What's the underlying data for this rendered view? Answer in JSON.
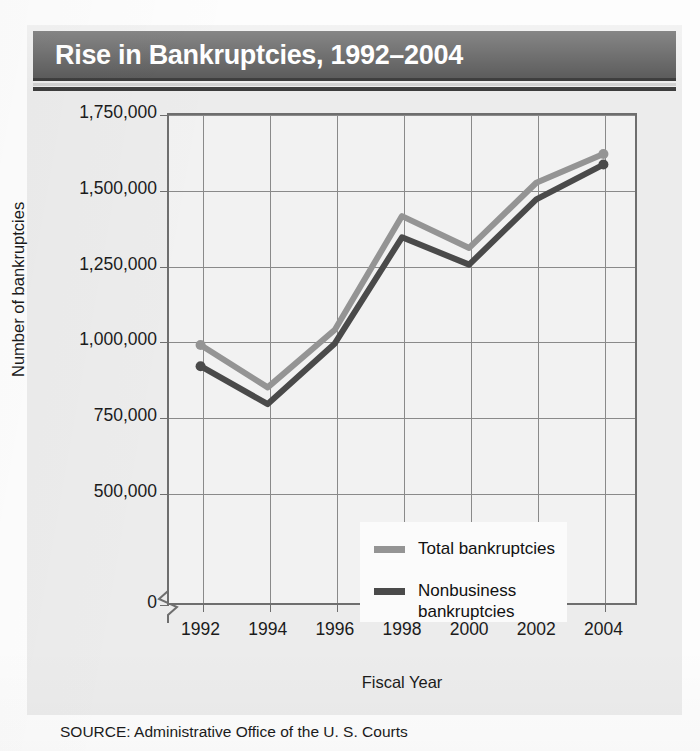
{
  "figure": {
    "title": "Rise in Bankruptcies, 1992–2004",
    "source": "SOURCE: Administrative Office of the U. S. Courts"
  },
  "colors": {
    "title_bar": "#4e4e4e",
    "title_text": "#ffffff",
    "panel_background": "#ececec",
    "plot_background": "#f2f2f2",
    "axis": "#6e6e6e",
    "gridline": "#8a8a8a",
    "total_series": "#949494",
    "nonbusiness_series": "#4a4a4a"
  },
  "chart_data": {
    "type": "line",
    "title": "Rise in Bankruptcies, 1992–2004",
    "xlabel": "Fiscal Year",
    "ylabel": "Number of bankruptcies",
    "x": [
      1992,
      1994,
      1996,
      1998,
      2000,
      2002,
      2004
    ],
    "xtick_labels": [
      "1992",
      "1994",
      "1996",
      "1998",
      "2000",
      "2002",
      "2004"
    ],
    "ytick_values": [
      0,
      500000,
      750000,
      1000000,
      1250000,
      1500000,
      1750000
    ],
    "ytick_labels": [
      "0",
      "500,000",
      "750,000",
      "1,000,000",
      "1,250,000",
      "1,500,000",
      "1,750,000"
    ],
    "ylim": [
      0,
      1750000
    ],
    "y_axis_break": true,
    "y_axis_break_between": [
      0,
      500000
    ],
    "grid": true,
    "legend_position": "inside lower-center-right",
    "series": [
      {
        "name": "Total bankruptcies",
        "color": "#949494",
        "values": [
          985000,
          845000,
          1035000,
          1410000,
          1305000,
          1520000,
          1615000
        ]
      },
      {
        "name": "Nonbusiness bankruptcies",
        "color": "#4a4a4a",
        "values": [
          915000,
          790000,
          990000,
          1340000,
          1250000,
          1465000,
          1580000
        ]
      }
    ]
  },
  "legend": {
    "items": [
      {
        "label": "Total bankruptcies",
        "label_line2": ""
      },
      {
        "label": "Nonbusiness",
        "label_line2": "bankruptcies"
      }
    ]
  }
}
